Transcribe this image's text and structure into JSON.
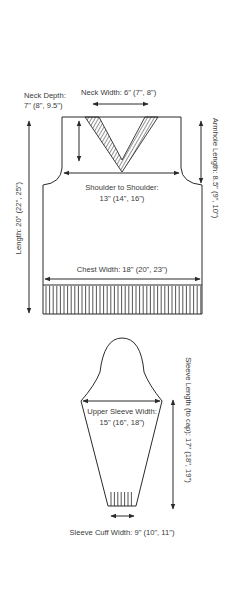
{
  "diagram": {
    "type": "knitting-schematic",
    "body": {
      "neck_depth_label": "Neck Depth:",
      "neck_depth_value": "7\" (8\", 9.5\")",
      "neck_width": "Neck Width: 6\" (7\", 8\")",
      "armhole_length": "Armhole Length: 8.5\" (9\", 10\")",
      "shoulder_label": "Shoulder to Shoulder:",
      "shoulder_value": "13\" (14\", 16\")",
      "length": "Length: 20\" (22\", 25\")",
      "chest_width": "Chest Width: 18\" (20\", 23\")"
    },
    "sleeve": {
      "upper_width_label": "Upper Sleeve Width:",
      "upper_width_value": "15\" (16\", 18\")",
      "length": "Sleeve Length (to cap): 17\" (18\", 19\")",
      "cuff_width": "Sleeve Cuff Width: 9\" (10\", 11\")"
    },
    "colors": {
      "line": "#2a2a2a",
      "text": "#3a3a3a",
      "background": "#ffffff"
    }
  }
}
